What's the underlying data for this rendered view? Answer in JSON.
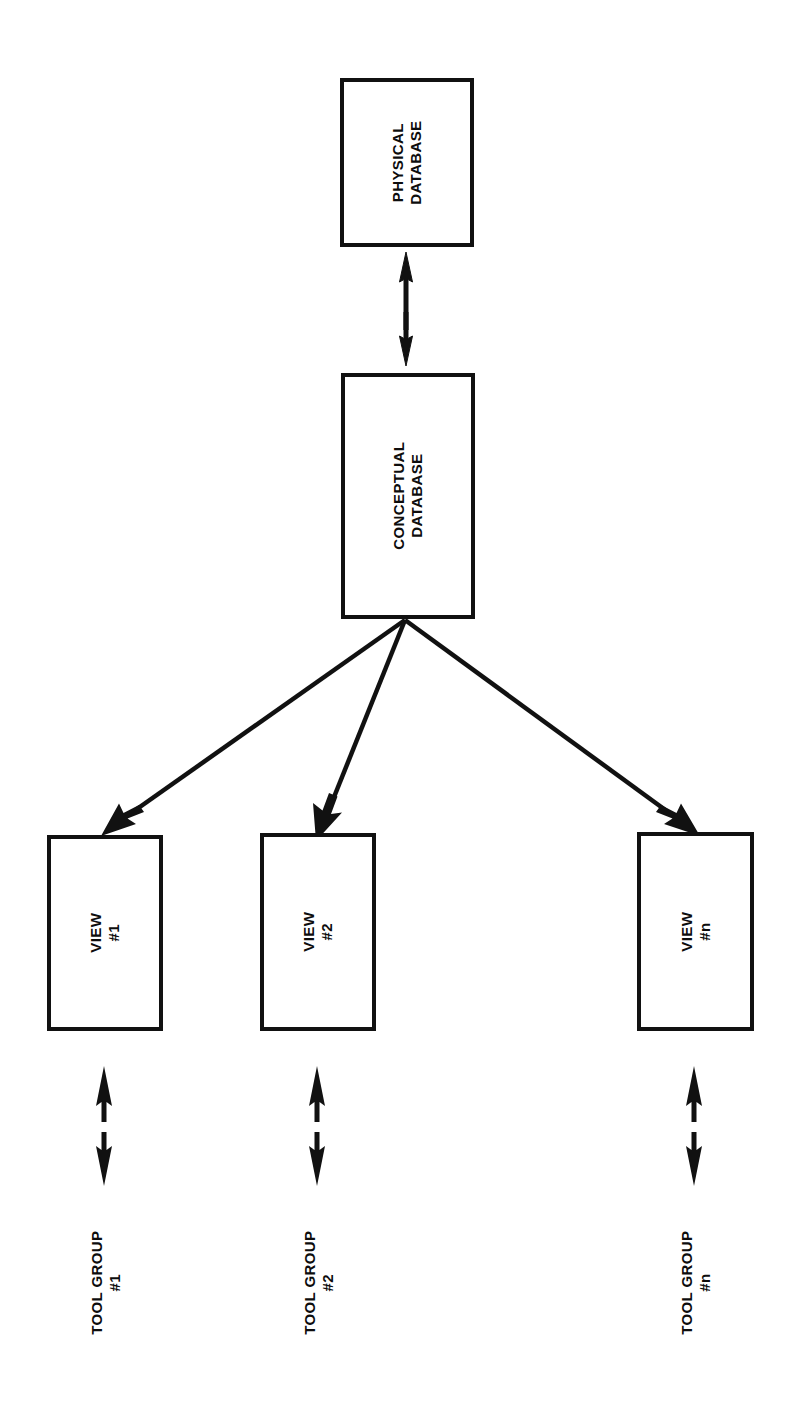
{
  "diagram": {
    "orientation": "rotated-90-ccw",
    "background_color": "#ffffff",
    "line_color": "#111111",
    "text_color": "#0d0d0d",
    "nodes": {
      "physical_database": {
        "line1": "PHYSICAL",
        "line2": "DATABASE"
      },
      "conceptual_database": {
        "line1": "CONCEPTUAL",
        "line2": "DATABASE"
      },
      "view1": {
        "line1": "VIEW",
        "line2": "#1"
      },
      "view2": {
        "line1": "VIEW",
        "line2": "#2"
      },
      "viewn": {
        "line1": "VIEW",
        "line2": "#n"
      }
    },
    "labels": {
      "tool_group_1": {
        "line1": "TOOL GROUP",
        "line2": "#1"
      },
      "tool_group_2": {
        "line1": "TOOL GROUP",
        "line2": "#2"
      },
      "tool_group_n": {
        "line1": "TOOL GROUP",
        "line2": "#n"
      }
    },
    "connectors": [
      {
        "name": "physical-conceptual-arrow",
        "kind": "double-arrow",
        "from": "physical_database",
        "to": "conceptual_database"
      },
      {
        "name": "conceptual-view1-arrow",
        "kind": "single-arrow",
        "from": "conceptual_database",
        "to": "view1"
      },
      {
        "name": "conceptual-view2-arrow",
        "kind": "single-arrow",
        "from": "conceptual_database",
        "to": "view2"
      },
      {
        "name": "conceptual-viewn-arrow",
        "kind": "single-arrow",
        "from": "conceptual_database",
        "to": "viewn"
      },
      {
        "name": "view1-toolgroup1-arrow",
        "kind": "double-arrow",
        "from": "view1",
        "to": "tool_group_1"
      },
      {
        "name": "view2-toolgroup2-arrow",
        "kind": "double-arrow",
        "from": "view2",
        "to": "tool_group_2"
      },
      {
        "name": "viewn-toolgroupn-arrow",
        "kind": "double-arrow",
        "from": "viewn",
        "to": "tool_group_n"
      }
    ]
  }
}
